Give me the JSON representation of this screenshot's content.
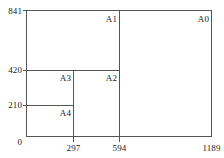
{
  "figure": {
    "type": "nested-rectangles-diagram",
    "stroke_color": "#555555",
    "text_color": "#1a1a1a",
    "background_color": "#ffffff"
  },
  "axes": {
    "x": {
      "min": 0,
      "max": 1189,
      "ticks": [
        {
          "value": 0,
          "label": "0",
          "px": 26
        },
        {
          "value": 297,
          "label": "297",
          "px": 73
        },
        {
          "value": 594,
          "label": "594",
          "px": 119
        },
        {
          "value": 1189,
          "label": "1189",
          "px": 211
        }
      ]
    },
    "y": {
      "min": 0,
      "max": 841,
      "ticks": [
        {
          "value": 0,
          "label": "0",
          "px": 136
        },
        {
          "value": 210,
          "label": "210",
          "px": 105
        },
        {
          "value": 420,
          "label": "420",
          "px": 70
        },
        {
          "value": 841,
          "label": "841",
          "px": 11
        }
      ]
    }
  },
  "regions": [
    {
      "id": "A0",
      "label": "A0",
      "x0": 0,
      "y0": 0,
      "x1": 1189,
      "y1": 841
    },
    {
      "id": "A1",
      "label": "A1",
      "x0": 0,
      "y0": 0,
      "x1": 594,
      "y1": 841
    },
    {
      "id": "A2",
      "label": "A2",
      "x0": 0,
      "y0": 0,
      "x1": 594,
      "y1": 420
    },
    {
      "id": "A3",
      "label": "A3",
      "x0": 0,
      "y0": 0,
      "x1": 297,
      "y1": 420
    },
    {
      "id": "A4",
      "label": "A4",
      "x0": 0,
      "y0": 0,
      "x1": 297,
      "y1": 210
    }
  ],
  "labels": {
    "a0": "A0",
    "a1": "A1",
    "a2": "A2",
    "a3": "A3",
    "a4": "A4",
    "y_841": "841",
    "y_420": "420",
    "y_210": "210",
    "origin": "0",
    "x_297": "297",
    "x_594": "594",
    "x_1189": "1189"
  }
}
